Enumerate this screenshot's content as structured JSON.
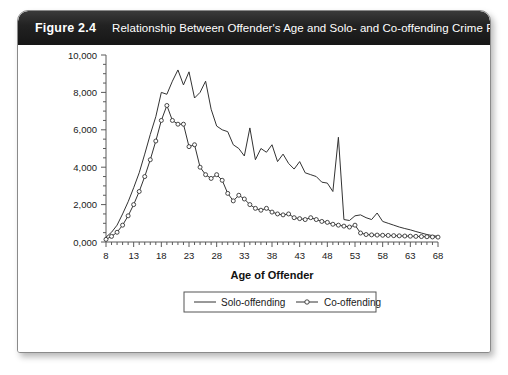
{
  "figure": {
    "label": "Figure 2.4",
    "title": "Relationship Between Offender's Age and Solo- and Co-offending Crime Rates"
  },
  "chart_data": {
    "type": "line",
    "title": "Relationship Between Offender's Age and Solo- and Co-offending Crime Rates",
    "xlabel": "Age of Offender",
    "ylabel": "",
    "xlim": [
      8,
      68
    ],
    "ylim": [
      0,
      10000
    ],
    "xtick_step": 1,
    "xtick_labels": [
      "8",
      "13",
      "18",
      "23",
      "28",
      "33",
      "38",
      "43",
      "48",
      "53",
      "58",
      "63",
      "68"
    ],
    "xtick_label_values": [
      8,
      13,
      18,
      23,
      28,
      33,
      38,
      43,
      48,
      53,
      58,
      63,
      68
    ],
    "ytick_labels": [
      "0,000",
      "2,000",
      "4,000",
      "6,000",
      "8,000",
      "10,000"
    ],
    "ytick_values": [
      0,
      2000,
      4000,
      6000,
      8000,
      10000
    ],
    "grid": false,
    "legend_position": "below-axis-center",
    "x": [
      8,
      9,
      10,
      11,
      12,
      13,
      14,
      15,
      16,
      17,
      18,
      19,
      20,
      21,
      22,
      23,
      24,
      25,
      26,
      27,
      28,
      29,
      30,
      31,
      32,
      33,
      34,
      35,
      36,
      37,
      38,
      39,
      40,
      41,
      42,
      43,
      44,
      45,
      46,
      47,
      48,
      49,
      50,
      51,
      52,
      53,
      54,
      55,
      56,
      57,
      58,
      59,
      60,
      61,
      62,
      63,
      64,
      65,
      66,
      67,
      68
    ],
    "series": [
      {
        "name": "Solo-offending",
        "marker": "none",
        "values": [
          260,
          520,
          900,
          1500,
          2150,
          2900,
          3700,
          4700,
          5750,
          6700,
          8000,
          7900,
          8600,
          9200,
          8400,
          9100,
          7700,
          8000,
          8600,
          7100,
          6200,
          6000,
          5900,
          5200,
          5000,
          4600,
          6100,
          4400,
          5000,
          4800,
          5200,
          4300,
          4700,
          4200,
          3900,
          4300,
          3700,
          3600,
          3500,
          3200,
          3150,
          2700,
          5600,
          1200,
          1150,
          1400,
          1450,
          1300,
          1200,
          1550,
          1100,
          1000,
          900,
          800,
          720,
          650,
          560,
          480,
          400,
          340,
          300
        ]
      },
      {
        "name": "Co-offending",
        "marker": "circle",
        "values": [
          140,
          300,
          520,
          900,
          1400,
          2000,
          2700,
          3500,
          4400,
          5400,
          6500,
          7300,
          6500,
          6300,
          6300,
          5100,
          5200,
          4000,
          3600,
          3400,
          3600,
          3300,
          2600,
          2200,
          2500,
          2300,
          2000,
          1800,
          1700,
          1800,
          1600,
          1500,
          1450,
          1500,
          1300,
          1250,
          1200,
          1300,
          1200,
          1100,
          1050,
          950,
          900,
          850,
          800,
          900,
          480,
          400,
          380,
          370,
          360,
          350,
          340,
          330,
          320,
          310,
          300,
          290,
          280,
          270,
          260
        ]
      }
    ]
  },
  "legend": {
    "items": [
      {
        "label": "Solo-offending",
        "marker": "none"
      },
      {
        "label": "Co-offending",
        "marker": "circle"
      }
    ]
  },
  "axis_title": "Age of Offender"
}
